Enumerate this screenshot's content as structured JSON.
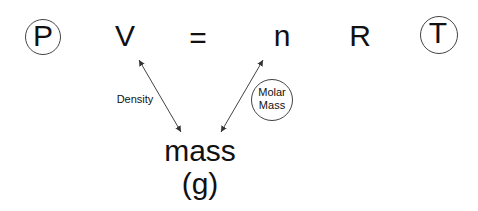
{
  "equation": {
    "terms": [
      "P",
      "V",
      "=",
      "n",
      "R",
      "T"
    ],
    "circled_terms": [
      "P",
      "T"
    ]
  },
  "relations": [
    {
      "label": "Density",
      "from": "V",
      "to": "mass",
      "arrow": "double-headed"
    },
    {
      "label": "Molar Mass",
      "label_lines": [
        "Molar",
        "Mass"
      ],
      "from": "n",
      "to": "mass",
      "arrow": "double-headed",
      "label_circled": true
    }
  ],
  "target": {
    "label": "mass",
    "unit": "(g)"
  }
}
